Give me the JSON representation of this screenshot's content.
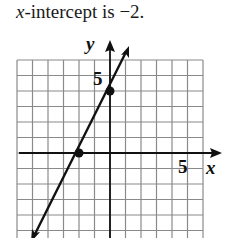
{
  "caption": {
    "var": "x",
    "text": "-intercept is −2."
  },
  "axes": {
    "x_label": "x",
    "y_label": "y",
    "x_tick_label": "5",
    "y_tick_label": "5"
  },
  "chart_data": {
    "type": "line",
    "title": "x-intercept is −2.",
    "xlabel": "x",
    "ylabel": "y",
    "xlim": [
      -6,
      6
    ],
    "ylim": [
      -5,
      6
    ],
    "grid": true,
    "tick_labels": {
      "x": [
        "5"
      ],
      "y": [
        "5"
      ]
    },
    "series": [
      {
        "name": "y = 2x + 4",
        "slope": 2,
        "intercept": 4,
        "x": [
          -4.5,
          1.2
        ],
        "y": [
          -5,
          6.4
        ]
      }
    ],
    "points": [
      {
        "x": -2,
        "y": 0,
        "label": "x-intercept"
      },
      {
        "x": 0,
        "y": 4,
        "label": "y-intercept"
      }
    ]
  }
}
